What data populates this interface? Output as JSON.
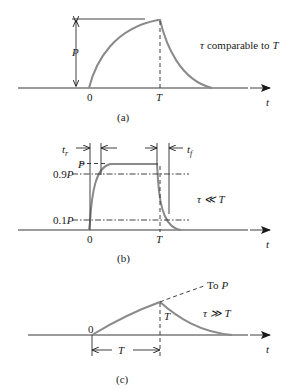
{
  "figure": {
    "colors": {
      "curve": "#8a8a8a",
      "lines": "#2a2a2a",
      "background": "#ffffff"
    },
    "panel_a": {
      "caption": "(a)",
      "amplitude_label": "P",
      "origin_label": "0",
      "period_label": "T",
      "axis_label": "t",
      "condition_symbol": "τ",
      "condition_text": "comparable to",
      "condition_rhs": "T"
    },
    "panel_b": {
      "caption": "(b)",
      "rise_label": "t",
      "rise_sub": "r",
      "fall_label": "t",
      "fall_sub": "f",
      "level_p": "P",
      "level_09p": "0.9",
      "level_09p_var": "P",
      "level_01p": "0.1",
      "level_01p_var": "P",
      "origin_label": "0",
      "period_label": "T",
      "axis_label": "t",
      "condition": "τ ≪ T"
    },
    "panel_c": {
      "caption": "(c)",
      "asymptote_prefix": "To",
      "asymptote_var": "P",
      "origin_label": "0",
      "period_label": "T",
      "width_label": "T",
      "axis_label": "t",
      "condition": "τ ≫ T"
    }
  }
}
